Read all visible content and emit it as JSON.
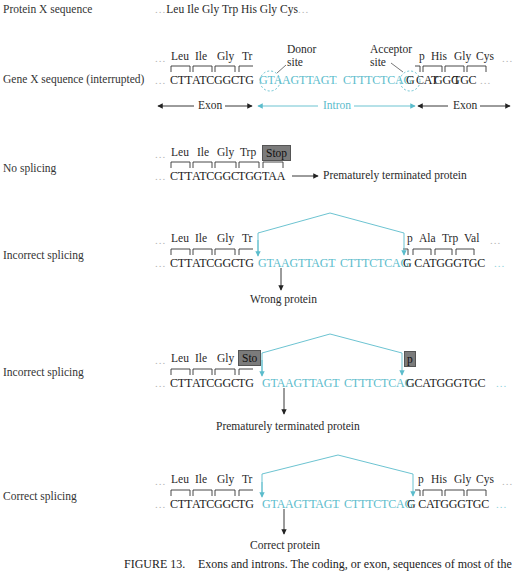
{
  "rows": {
    "protein": {
      "label": "Protein X sequence",
      "sequence_lead": "...",
      "sequence": "Leu Ile Gly Trp His Gly Cys",
      "sequence_tail": "..."
    },
    "gene": {
      "label": "Gene X sequence (interrupted)",
      "amino_left": [
        "Leu",
        "Ile",
        "Gly",
        "Tr"
      ],
      "amino_right": [
        "p",
        "His",
        "Gly",
        "Cys"
      ],
      "codons_left": [
        "CTT",
        "ATC",
        "GGC",
        "TG"
      ],
      "intron_start": "GTAAGTTAGT",
      "intron_end": "CTTTCTCAG",
      "codons_right": [
        "G",
        "CAT",
        "GGG",
        "TGC"
      ],
      "ellipsis": "...",
      "donor_label": "Donor site",
      "donor_line1": "Donor",
      "donor_line2": "site",
      "acceptor_line1": "Acceptor",
      "acceptor_line2": "site",
      "exon_left_label": "Exon",
      "intron_label": "Intron",
      "exon_right_label": "Exon"
    },
    "no_splicing": {
      "label": "No splicing",
      "amino": [
        "Leu",
        "Ile",
        "Gly",
        "Trp"
      ],
      "stop_label": "Stop",
      "dna": [
        "CTT",
        "ATC",
        "GGC",
        "TGG",
        "TAA"
      ],
      "result": "Prematurely terminated protein"
    },
    "incorrect_1": {
      "label": "Incorrect splicing",
      "amino_left": [
        "Leu",
        "Ile",
        "Gly",
        "Tr"
      ],
      "amino_right": [
        "p",
        "Ala",
        "Trp",
        "Val"
      ],
      "codons_left": [
        "CTT",
        "ATC",
        "GGC",
        "TG"
      ],
      "intron_start": "GTAAGTTAGT",
      "intron_end": "CTTTCTCAG",
      "codons_right": "G CATGGGTGC",
      "result": "Wrong protein"
    },
    "incorrect_2": {
      "label": "Incorrect splicing",
      "amino_left": [
        "Leu",
        "Ile",
        "Gly"
      ],
      "stop_left": "Sto",
      "stop_right": "p",
      "codons_left": [
        "CTT",
        "ATC",
        "GGC",
        "TG"
      ],
      "intron_start": "GTAAGTTAGT",
      "intron_end": "CTTTCTCAC",
      "codons_right": "GCATGGGTGC",
      "result": "Prematurely terminated protein"
    },
    "correct": {
      "label": "Correct splicing",
      "amino_left": [
        "Leu",
        "Ile",
        "Gly",
        "Tr"
      ],
      "amino_right": [
        "p",
        "His",
        "Gly",
        "Cys"
      ],
      "codons_left": [
        "CTT",
        "ATC",
        "GGC",
        "TG"
      ],
      "intron_start": "GTAAGTTAGT",
      "intron_end": "CTTTCTCAG",
      "codons_right": "G CATGGGTGC",
      "result": "Correct protein"
    }
  },
  "caption": {
    "figure_label": "FIGURE 13.",
    "text": "Exons and introns. The coding, or exon, sequences of most of the"
  },
  "colors": {
    "intron": "#5bbccc",
    "stop_box": "#7b7b7b",
    "text": "#1f1f1f"
  }
}
